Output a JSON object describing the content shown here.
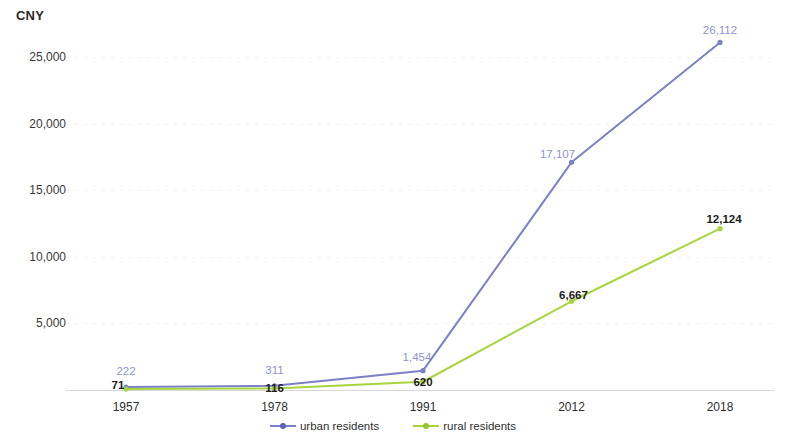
{
  "chart_data": {
    "type": "line",
    "title": "",
    "subtitle": "",
    "xlabel": "",
    "ylabel": "CNY",
    "categories": [
      "1957",
      "1978",
      "1991",
      "2012",
      "2018"
    ],
    "ylim": [
      0,
      27500
    ],
    "yticks": [
      5000,
      10000,
      15000,
      20000,
      25000
    ],
    "ytick_labels": [
      "5,000",
      "10,000",
      "15,000",
      "20,000",
      "25,000"
    ],
    "grid": true,
    "legend_position": "bottom",
    "series": [
      {
        "name": "urban residents",
        "color": "#7b80c7",
        "label_color": "#8e93cf",
        "values": [
          222,
          311,
          1454,
          17107,
          26112
        ],
        "value_labels": [
          "222",
          "311",
          "1,454",
          "17,107",
          "26,112"
        ]
      },
      {
        "name": "rural residents",
        "color": "#a8d43f",
        "label_color": "#1c1c1c",
        "values": [
          71,
          116,
          620,
          6667,
          12124
        ],
        "value_labels": [
          "71",
          "116",
          "620",
          "6,667",
          "12,124"
        ]
      }
    ]
  },
  "legend": {
    "items": [
      {
        "label": "urban residents",
        "swatch": "sw-urban"
      },
      {
        "label": "rural residents",
        "swatch": "sw-rural"
      }
    ]
  }
}
